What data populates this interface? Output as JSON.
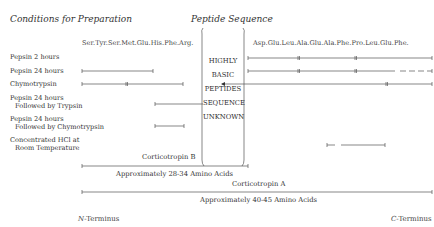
{
  "headings": {
    "conditions": "Conditions for Preparation",
    "peptide": "Peptide Sequence"
  },
  "sequences": {
    "left": "Ser.Tyr.Ser.Met.Glu.His.Phe.Arg.",
    "right": "Asp.Glu.Leu.Ala.Glu.Ala.Phe.Pro.Leu.Glu.Phe."
  },
  "center_box": [
    "HIGHLY",
    "BASIC",
    "PEPTIDES",
    "SEQUENCE",
    "UNKNOWN"
  ],
  "conditions": [
    {
      "line1": "Pepsin 2 hours",
      "line2": ""
    },
    {
      "line1": "Pepsin 24 hours",
      "line2": ""
    },
    {
      "line1": "Chymotrypsin",
      "line2": ""
    },
    {
      "line1": "Pepsin 24 hours",
      "line2": "Followed by Trypsin"
    },
    {
      "line1": "Pepsin 24 hours",
      "line2": "Followed by Chymotrypsin"
    },
    {
      "line1": "Concentrated HCl at",
      "line2": "Room Temperature"
    }
  ],
  "spans": {
    "corticotropin_b": {
      "name": "Corticotropin B",
      "size": "Approximately 28-34 Amino Acids"
    },
    "corticotropin_a": {
      "name": "Corticotropin A",
      "size": "Approximately 40-45 Amino Acids"
    }
  },
  "termini": {
    "n_letter": "N",
    "n_rest": "-Terminus",
    "c_letter": "C",
    "c_rest": "-Terminus"
  },
  "colors": {
    "line": "#555555",
    "text": "#333333"
  }
}
